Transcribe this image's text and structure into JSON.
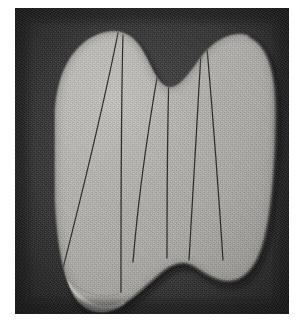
{
  "figure": {
    "title": "",
    "caption": "",
    "kind": "halftone-photograph"
  },
  "page": {
    "width_px": 304,
    "height_px": 332,
    "background_color": "#ffffff",
    "margin_left_px": 15,
    "margin_top_px": 8
  },
  "plate": {
    "width_px": 274,
    "height_px": 306,
    "background_color": "#2a2a2a",
    "background_color_light": "#4a4a4a",
    "vignette_color": "#171717"
  },
  "specimen": {
    "fill_color": "#b0aeab",
    "fill_color_light": "#c4c2bf",
    "fill_color_shadow": "#9a9894",
    "edge_highlight_color": "#dedcd8",
    "edge_shadow_color": "#3a3a38",
    "line_color": "#1d1d1d",
    "outline_path": "M 40 112 C 40 66, 58 38, 80 28 C 100 19, 116 24, 126 40 C 136 56, 140 72, 150 78 C 160 84, 170 72, 184 52 C 198 32, 218 22, 234 28 C 252 35, 262 62, 262 104 C 262 150, 258 200, 250 232 C 242 262, 228 275, 212 274 C 196 273, 184 262, 176 258 C 166 253, 156 258, 146 266 C 134 276, 124 286, 110 296 C 94 307, 76 307, 64 294 C 50 279, 42 240, 40 190 Z",
    "division_lines": [
      {
        "name": "line-1",
        "d": "M 103 25 C 90 90, 66 190, 46 268"
      },
      {
        "name": "line-2",
        "d": "M 108 27 C 106 95, 106 190, 106 284"
      },
      {
        "name": "line-3",
        "d": "M 150 25 C 136 100, 124 180, 118 254"
      },
      {
        "name": "line-4",
        "d": "M 155 30 C 152 110, 152 190, 152 250"
      },
      {
        "name": "line-5",
        "d": "M 186 44 C 182 110, 178 190, 174 252"
      },
      {
        "name": "line-6",
        "d": "M 192 40 C 198 110, 204 190, 208 252"
      }
    ],
    "segment_count": 4,
    "notch": {
      "top_center_x_px": 152,
      "depth_px": 52
    }
  },
  "labels": {
    "figure_label": "",
    "scale_bar": ""
  }
}
